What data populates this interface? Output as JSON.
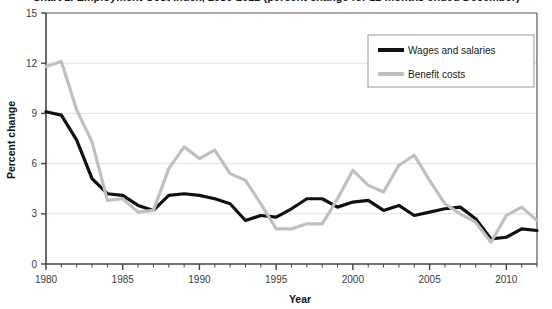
{
  "chart_data": {
    "type": "line",
    "title": "Chart 1.  Employment Cost Index, 1980-2012 (percent change for 12 months ended December)",
    "xlabel": "Year",
    "ylabel": "Percent change",
    "xlim": [
      1980,
      2012
    ],
    "ylim": [
      0,
      15
    ],
    "yticks": [
      0,
      3,
      6,
      9,
      12,
      15
    ],
    "ytick_labels": [
      "0",
      "3",
      "6",
      "9",
      "12",
      "15"
    ],
    "xticks": [
      1980,
      1985,
      1990,
      1995,
      2000,
      2005,
      2010
    ],
    "xtick_labels": [
      "1980",
      "1985",
      "1990",
      "1995",
      "2000",
      "2005",
      "2010"
    ],
    "grid": "horizontal",
    "legend_position": "top-right",
    "x": [
      1980,
      1981,
      1982,
      1983,
      1984,
      1985,
      1986,
      1987,
      1988,
      1989,
      1990,
      1991,
      1992,
      1993,
      1994,
      1995,
      1996,
      1997,
      1998,
      1999,
      2000,
      2001,
      2002,
      2003,
      2004,
      2005,
      2006,
      2007,
      2008,
      2009,
      2010,
      2011,
      2012
    ],
    "series": [
      {
        "name": "Wages and salaries",
        "color": "#111111",
        "width": 3.2,
        "values": [
          9.1,
          8.9,
          7.4,
          5.1,
          4.2,
          4.1,
          3.5,
          3.2,
          4.1,
          4.2,
          4.1,
          3.9,
          3.6,
          2.6,
          2.9,
          2.8,
          3.3,
          3.9,
          3.9,
          3.4,
          3.7,
          3.8,
          3.2,
          3.5,
          2.9,
          3.1,
          3.3,
          3.4,
          2.7,
          1.5,
          1.6,
          2.1,
          2.0
        ]
      },
      {
        "name": "Benefit costs",
        "color": "#c0c0c0",
        "width": 3.2,
        "values": [
          11.8,
          12.1,
          9.2,
          7.3,
          3.8,
          3.9,
          3.1,
          3.2,
          5.7,
          7.0,
          6.3,
          6.8,
          5.4,
          5.0,
          3.6,
          2.1,
          2.1,
          2.4,
          2.4,
          3.9,
          5.6,
          4.7,
          4.3,
          5.9,
          6.5,
          5.0,
          3.6,
          3.0,
          2.5,
          1.3,
          2.9,
          3.4,
          2.6
        ]
      }
    ]
  },
  "legend": {
    "items": [
      {
        "label": "Wages and salaries",
        "color": "#111111"
      },
      {
        "label": "Benefit costs",
        "color": "#c0c0c0"
      }
    ]
  }
}
